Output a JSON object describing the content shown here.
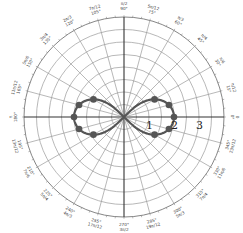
{
  "chart_data": {
    "type": "polar-line",
    "title": "",
    "equation_hint": "r^2 = 4 cos(2θ) (lemniscate)",
    "radial_axis": {
      "max": 4,
      "grid_step": 0.5,
      "labels": [
        {
          "value": 1,
          "text": "1"
        },
        {
          "value": 2,
          "text": "2"
        },
        {
          "value": 3,
          "text": "3"
        }
      ]
    },
    "angular_axis": {
      "step_deg": 15,
      "labels": [
        {
          "deg": 0,
          "deg_text": "0°",
          "rad_text": "0"
        },
        {
          "deg": 15,
          "deg_text": "15°",
          "rad_text": "π/12"
        },
        {
          "deg": 30,
          "deg_text": "30°",
          "rad_text": "π/6"
        },
        {
          "deg": 45,
          "deg_text": "45°",
          "rad_text": "π/4"
        },
        {
          "deg": 60,
          "deg_text": "60°",
          "rad_text": "π/3"
        },
        {
          "deg": 75,
          "deg_text": "75°",
          "rad_text": "5π/12"
        },
        {
          "deg": 90,
          "deg_text": "90°",
          "rad_text": "π/2"
        },
        {
          "deg": 105,
          "deg_text": "105°",
          "rad_text": "7π/12"
        },
        {
          "deg": 120,
          "deg_text": "120°",
          "rad_text": "2π/3"
        },
        {
          "deg": 135,
          "deg_text": "135°",
          "rad_text": "3π/4"
        },
        {
          "deg": 150,
          "deg_text": "150°",
          "rad_text": "5π/6"
        },
        {
          "deg": 165,
          "deg_text": "165°",
          "rad_text": "11π/12"
        },
        {
          "deg": 180,
          "deg_text": "180°",
          "rad_text": "π"
        },
        {
          "deg": 195,
          "deg_text": "195°",
          "rad_text": "13π/12"
        },
        {
          "deg": 210,
          "deg_text": "210°",
          "rad_text": "7π/6"
        },
        {
          "deg": 225,
          "deg_text": "225°",
          "rad_text": "5π/4"
        },
        {
          "deg": 240,
          "deg_text": "240°",
          "rad_text": "4π/3"
        },
        {
          "deg": 255,
          "deg_text": "255°",
          "rad_text": "17π/12"
        },
        {
          "deg": 270,
          "deg_text": "270°",
          "rad_text": "3π/2"
        },
        {
          "deg": 285,
          "deg_text": "285°",
          "rad_text": "19π/12"
        },
        {
          "deg": 300,
          "deg_text": "300°",
          "rad_text": "5π/3"
        },
        {
          "deg": 315,
          "deg_text": "315°",
          "rad_text": "7π/4"
        },
        {
          "deg": 330,
          "deg_text": "330°",
          "rad_text": "11π/6"
        },
        {
          "deg": 345,
          "deg_text": "345°",
          "rad_text": "23π/12"
        }
      ]
    },
    "series": [
      {
        "name": "lemniscate",
        "color": "#555555",
        "marker_points": [
          {
            "theta_deg": 0,
            "r": 2.0
          },
          {
            "theta_deg": 15,
            "r": 1.86
          },
          {
            "theta_deg": 30,
            "r": 1.41
          },
          {
            "theta_deg": -15,
            "r": 1.86
          },
          {
            "theta_deg": -30,
            "r": 1.41
          },
          {
            "theta_deg": 180,
            "r": 2.0
          },
          {
            "theta_deg": 165,
            "r": 1.86
          },
          {
            "theta_deg": 150,
            "r": 1.41
          },
          {
            "theta_deg": 195,
            "r": 1.86
          },
          {
            "theta_deg": 210,
            "r": 1.41
          }
        ]
      }
    ],
    "grid": true,
    "legend": null
  }
}
